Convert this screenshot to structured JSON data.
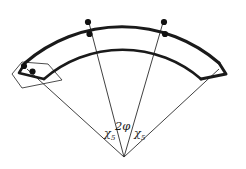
{
  "figure": {
    "type": "geometric-diagram",
    "background_color": "#ffffff",
    "stroke_color": "#1a1a1a",
    "dot_color": "#111111",
    "apex": {
      "x": 124,
      "y": 157
    },
    "arcs": {
      "outer": {
        "radius": 148,
        "top_y": 10,
        "thickness": 3.0
      },
      "inner": {
        "radius": 120,
        "top_y": 38,
        "thickness": 2.6
      }
    },
    "labels": [
      {
        "name": "chi-5-left",
        "main": "χ",
        "sub": "5",
        "x": 106,
        "y": 136
      },
      {
        "name": "two-phi",
        "main": "2φ",
        "sub": "",
        "x": 118,
        "y": 130
      },
      {
        "name": "chi-5-right",
        "main": "χ",
        "sub": "5",
        "x": 136,
        "y": 136
      }
    ],
    "dots": [
      {
        "name": "dot-left-outer-arc",
        "x": 88,
        "y": 22,
        "r": 3.1
      },
      {
        "name": "dot-left-inner-arc",
        "x": 89.5,
        "y": 34,
        "r": 3.1
      },
      {
        "name": "dot-right-outer-arc",
        "x": 164,
        "y": 22,
        "r": 3.1
      },
      {
        "name": "dot-right-inner-arc",
        "x": 165,
        "y": 34,
        "r": 3.1
      },
      {
        "name": "dot-end-cap-upper",
        "x": 24,
        "y": 66,
        "r": 3.1
      },
      {
        "name": "dot-end-cap-lower",
        "x": 32.5,
        "y": 71.5,
        "r": 3.1
      }
    ],
    "radial_lines": [
      {
        "name": "radial-line-far-left",
        "x1": 124,
        "y1": 157,
        "x2": 27,
        "y2": 70
      },
      {
        "name": "radial-line-inner-left",
        "x1": 124,
        "y1": 157,
        "x2": 88,
        "y2": 20
      },
      {
        "name": "radial-line-inner-right",
        "x1": 124,
        "y1": 157,
        "x2": 164,
        "y2": 20
      },
      {
        "name": "radial-line-far-right",
        "x1": 124,
        "y1": 157,
        "x2": 219,
        "y2": 70
      }
    ],
    "end_caps": {
      "left": {
        "name": "left-end-cap",
        "has_dots": true
      },
      "right": {
        "name": "right-end-cap",
        "has_dots": false
      }
    }
  }
}
